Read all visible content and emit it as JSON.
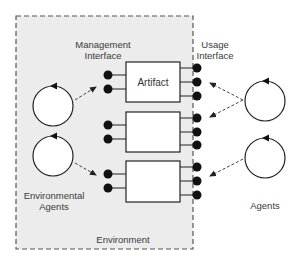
{
  "diagram": {
    "environment_label": "Environment",
    "management_interface_label": [
      "Management",
      "Interface"
    ],
    "usage_interface_label": [
      "Usage",
      "Interface"
    ],
    "environmental_agents_label": [
      "Environmental",
      "Agents"
    ],
    "agents_label": "Agents",
    "artifacts": [
      {
        "label": "Artifact",
        "management_ports": 2,
        "usage_ports": 3
      },
      {
        "label": "",
        "management_ports": 2,
        "usage_ports": 3
      },
      {
        "label": "",
        "management_ports": 2,
        "usage_ports": 3
      }
    ],
    "colors": {
      "environment_fill": "#ececec",
      "stroke": "#222222",
      "dash": "#555555"
    }
  }
}
